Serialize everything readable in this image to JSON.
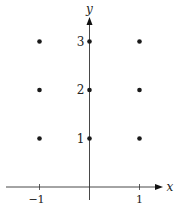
{
  "chart_data": {
    "type": "scatter",
    "title": "",
    "xlabel": "x",
    "ylabel": "y",
    "x_ticks": [
      -1,
      1
    ],
    "y_ticks": [
      1,
      2,
      3
    ],
    "x_tick_labels": [
      "−1",
      "1"
    ],
    "y_tick_labels": [
      "1",
      "2",
      "3"
    ],
    "xlim": [
      -1.7,
      1.5
    ],
    "ylim": [
      0,
      3.5
    ],
    "grid": false,
    "legend": null,
    "points": [
      {
        "x": -1,
        "y": 1
      },
      {
        "x": -1,
        "y": 2
      },
      {
        "x": -1,
        "y": 3
      },
      {
        "x": 0,
        "y": 1
      },
      {
        "x": 0,
        "y": 2
      },
      {
        "x": 0,
        "y": 3
      },
      {
        "x": 1,
        "y": 1
      },
      {
        "x": 1,
        "y": 2
      },
      {
        "x": 1,
        "y": 3
      }
    ],
    "point_color": "#1a1a1a",
    "axis_color": "#333333"
  }
}
